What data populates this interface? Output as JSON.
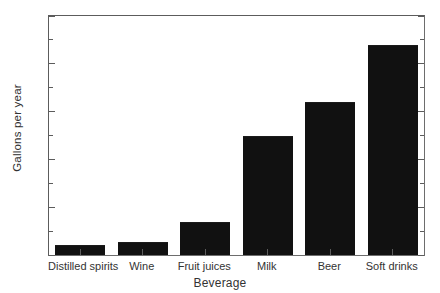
{
  "chart_data": {
    "type": "bar",
    "title": "",
    "subtitle": "",
    "xlabel": "Beverage",
    "ylabel": "Gallons per year",
    "categories": [
      "Distilled spirits",
      "Wine",
      "Fruit juices",
      "Milk",
      "Beer",
      "Soft drinks"
    ],
    "values": [
      2,
      2.7,
      7,
      25,
      32,
      44
    ],
    "ylim": [
      0,
      50
    ],
    "xlim_note": "categorical",
    "ytick_labels": [
      "0",
      "10",
      "20",
      "30",
      "40",
      "50"
    ],
    "ytick_values": [
      0,
      10,
      20,
      30,
      40,
      50
    ],
    "yminor_tick_values": [
      5,
      15,
      25,
      35,
      45
    ],
    "grid": false,
    "legend": false,
    "legend_position": "none",
    "bar_color": "#111111",
    "frame_color": "#5c5c5c",
    "background_color": "#ffffff",
    "annotations": []
  }
}
